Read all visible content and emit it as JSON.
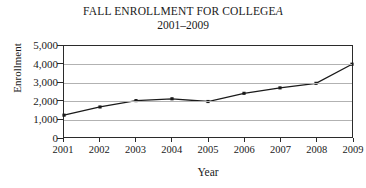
{
  "chart_data": {
    "type": "line",
    "title_prefix": "FALL ENROLLMENT FOR COLLEGE",
    "title_italic_suffix": "A",
    "subtitle": "2001–2009",
    "xlabel": "Year",
    "ylabel": "Enrollment",
    "categories": [
      "2001",
      "2002",
      "2003",
      "2004",
      "2005",
      "2006",
      "2007",
      "2008",
      "2009"
    ],
    "values": [
      1200,
      1650,
      2000,
      2100,
      1950,
      2400,
      2700,
      2950,
      4000
    ],
    "ylim": [
      0,
      5000
    ],
    "yticks": [
      0,
      1000,
      2000,
      3000,
      4000,
      5000
    ],
    "ytick_labels": [
      "0",
      "1,000",
      "2,000",
      "3,000",
      "4,000",
      "5,000"
    ],
    "grid": true,
    "legend": false,
    "series_color": "#1a1a1a",
    "grid_color": "#b2b2b2",
    "frame_color": "#2b2b2b",
    "marker": "square"
  }
}
